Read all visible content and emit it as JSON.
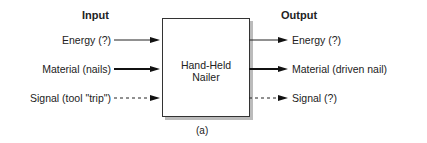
{
  "diagram": {
    "input_header": "Input",
    "output_header": "Output",
    "box_label_line1": "Hand-Held",
    "box_label_line2": "Nailer",
    "caption": "(a)",
    "inputs": [
      {
        "label": "Energy (?)",
        "style": "thin"
      },
      {
        "label": "Material (nails)",
        "style": "thick"
      },
      {
        "label": "Signal (tool \"trip\")",
        "style": "dashed"
      }
    ],
    "outputs": [
      {
        "label": "Energy (?)",
        "style": "thin"
      },
      {
        "label": "Material (driven nail)",
        "style": "thick"
      },
      {
        "label": "Signal (?)",
        "style": "dashed"
      }
    ]
  }
}
